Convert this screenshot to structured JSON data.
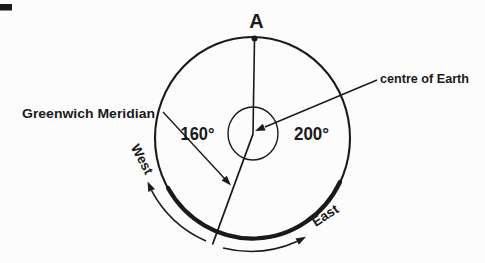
{
  "colors": {
    "ink": "#1a1a1a",
    "background": "#fcfcfc"
  },
  "diagram": {
    "point_label": "A",
    "angle_left": "160°",
    "angle_right": "200°",
    "centre_label": "centre of Earth",
    "meridian_label": "Greenwich Meridian",
    "direction_west": "West",
    "direction_east": "East"
  }
}
